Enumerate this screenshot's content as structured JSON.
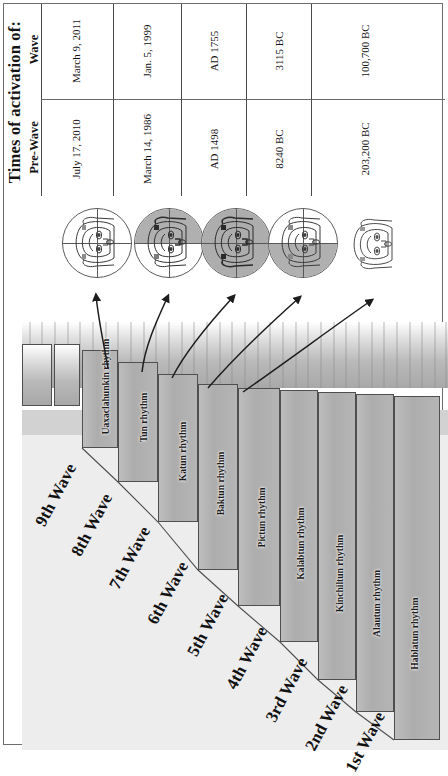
{
  "table": {
    "title": "Times of activation of:",
    "row_headers": [
      "Wave",
      "Pre-Wave"
    ],
    "columns": [
      {
        "wave": "March 9, 2011",
        "pre_wave": "July 17, 2010"
      },
      {
        "wave": "Jan. 5, 1999",
        "pre_wave": "March 14, 1986"
      },
      {
        "wave": "AD 1755",
        "pre_wave": "AD 1498"
      },
      {
        "wave": "3115 BC",
        "pre_wave": "8240 BC"
      },
      {
        "wave": "100,700 BC",
        "pre_wave": "203,200 BC"
      }
    ]
  },
  "heads": [
    {
      "name": "head-quadrant-unshaded",
      "shading": "none",
      "circle": true
    },
    {
      "name": "head-quadrant-top-shaded",
      "shading": "top",
      "circle": true
    },
    {
      "name": "head-quadrant-full-shaded",
      "shading": "full",
      "circle": true
    },
    {
      "name": "head-quadrant-bottom-shaded",
      "shading": "bottom",
      "circle": true
    },
    {
      "name": "head-no-circle",
      "shading": "none",
      "circle": false
    }
  ],
  "waves": [
    {
      "wave_label": "9th Wave",
      "rhythm": "Uaxaclahunkin rhythm"
    },
    {
      "wave_label": "8th Wave",
      "rhythm": "Tun rhythm"
    },
    {
      "wave_label": "7th Wave",
      "rhythm": "Katun rhythm"
    },
    {
      "wave_label": "6th Wave",
      "rhythm": "Baktun rhythm"
    },
    {
      "wave_label": "5th Wave",
      "rhythm": "Pictun rhythm"
    },
    {
      "wave_label": "4th Wave",
      "rhythm": "Kalabtun rhythm"
    },
    {
      "wave_label": "3rd Wave",
      "rhythm": "Kinchiltun rhythm"
    },
    {
      "wave_label": "2nd Wave",
      "rhythm": "Alautun rhythm"
    },
    {
      "wave_label": "1st Wave",
      "rhythm": "Hablatun rhythm"
    }
  ],
  "colors": {
    "stair_fill": "#b3b3b3",
    "base_fill": "#eaeaea",
    "line": "#4f4f4f",
    "shade": "#b0b0b0",
    "text": "#141414"
  }
}
